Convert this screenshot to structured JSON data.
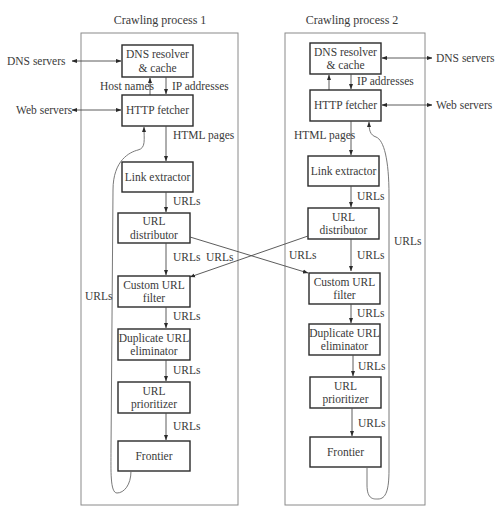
{
  "diagram": {
    "process1": {
      "title": "Crawling process 1",
      "boxes": {
        "dns": [
          "DNS resolver",
          "& cache"
        ],
        "http": [
          "HTTP fetcher"
        ],
        "link": [
          "Link extractor"
        ],
        "distributor": [
          "URL",
          "distributor"
        ],
        "filter": [
          "Custom URL",
          "filter"
        ],
        "dedup": [
          "Duplicate URL",
          "eliminator"
        ],
        "prioritizer": [
          "URL",
          "prioritizer"
        ],
        "frontier": [
          "Frontier"
        ]
      },
      "labels": {
        "dns_servers": "DNS servers",
        "web_servers": "Web servers",
        "host_names": "Host names",
        "ip_addresses": "IP addresses",
        "html_pages": "HTML pages",
        "urls_link_to_dist": "URLs",
        "urls_dist_to_filter": "URLs",
        "urls_filter_to_dedup": "URLs",
        "urls_dedup_to_prior": "URLs",
        "urls_prior_to_frontier": "URLs",
        "urls_loop": "URLs",
        "urls_cross_in": "URLs"
      }
    },
    "process2": {
      "title": "Crawling process 2",
      "boxes": {
        "dns": [
          "DNS resolver",
          "& cache"
        ],
        "http": [
          "HTTP fetcher"
        ],
        "link": [
          "Link extractor"
        ],
        "distributor": [
          "URL",
          "distributor"
        ],
        "filter": [
          "Custom URL",
          "filter"
        ],
        "dedup": [
          "Duplicate URL",
          "eliminator"
        ],
        "prioritizer": [
          "URL",
          "prioritizer"
        ],
        "frontier": [
          "Frontier"
        ]
      },
      "labels": {
        "dns_servers": "DNS servers",
        "web_servers": "Web servers",
        "ip_addresses": "IP addresses",
        "html_pages": "HTML pages",
        "urls_link_to_dist": "URLs",
        "urls_dist_to_filter": "URLs",
        "urls_filter_to_dedup": "URLs",
        "urls_dedup_to_prior": "URLs",
        "urls_prior_to_frontier": "URLs",
        "urls_loop": "URLs",
        "urls_cross_in": "URLs"
      }
    },
    "colors": {
      "box_stroke": "#2a2a2a",
      "frame_stroke": "#8a8a8a",
      "text": "#3a3a3a",
      "background": "#ffffff"
    }
  }
}
